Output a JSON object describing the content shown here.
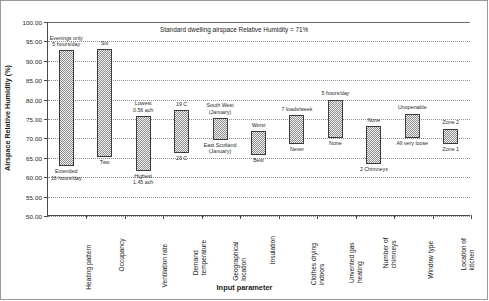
{
  "chart_data": {
    "type": "bar",
    "subtype": "floating-range-bar",
    "title": "",
    "note": "Standard dwelling airspace Relative Humidity = 71%",
    "xlabel": "Input parameter",
    "ylabel": "Airspace Relative Humidity (%)",
    "ylim": [
      50.0,
      100.0
    ],
    "ytick_step": 5.0,
    "ytick_labels": [
      "100.00",
      "95.00",
      "90.00",
      "85.00",
      "80.00",
      "75.00",
      "70.00",
      "65.00",
      "60.00",
      "55.00",
      "50.00"
    ],
    "grid": true,
    "legend": "none",
    "categories": [
      "Heating pattern",
      "Occupancy",
      "Ventilation rate",
      "Demand temperature",
      "Geographical location",
      "Insulation",
      "Clothes drying indoors",
      "Unvented gas heating",
      "Number of chimneys",
      "Window type",
      "Location of kitchen"
    ],
    "category_labels_wrapped": [
      "Heating pattern",
      "Occupancy",
      "Ventilation rate",
      "Demand\ntemperature",
      "Geographical\nlocation",
      "Insulation",
      "Clothes drying\nindoors",
      "Unvented gas\nheating",
      "Number of\nchimneys",
      "Window type",
      "Location of\nkitchen"
    ],
    "bars": [
      {
        "category": "Heating pattern",
        "low": 62.8,
        "high": 92.7,
        "top_label": "Evenings only\n5 hours/day",
        "bottom_label": "Extended\n16 hours/day"
      },
      {
        "category": "Occupancy",
        "low": 65.3,
        "high": 93.0,
        "top_label": "Six",
        "bottom_label": "Two"
      },
      {
        "category": "Ventilation rate",
        "low": 61.7,
        "high": 75.7,
        "top_label": "Lowest\n0.56 ach",
        "bottom_label": "Highest\n1.45 ach"
      },
      {
        "category": "Demand temperature",
        "low": 66.2,
        "high": 77.2,
        "top_label": "19 C",
        "bottom_label": "23 C"
      },
      {
        "category": "Geographical location",
        "low": 69.6,
        "high": 75.2,
        "top_label": "South West\n(January)",
        "bottom_label": "East Scotland\n(January)"
      },
      {
        "category": "Insulation",
        "low": 65.8,
        "high": 71.8,
        "top_label": "Worst",
        "bottom_label": "Best"
      },
      {
        "category": "Clothes drying indoors",
        "low": 68.5,
        "high": 76.0,
        "top_label": "7 loads/week",
        "bottom_label": "Never"
      },
      {
        "category": "Unvented gas heating",
        "low": 70.2,
        "high": 80.0,
        "top_label": "5 hours/day",
        "bottom_label": "None"
      },
      {
        "category": "Number of chimneys",
        "low": 63.5,
        "high": 73.2,
        "top_label": "None",
        "bottom_label": "2 Chimneys"
      },
      {
        "category": "Window type",
        "low": 70.2,
        "high": 76.4,
        "top_label": "Unopenable",
        "bottom_label": "All very loose"
      },
      {
        "category": "Location of kitchen",
        "low": 68.5,
        "high": 72.5,
        "top_label": "Zone 2",
        "bottom_label": "Zone 1"
      }
    ]
  },
  "colors": {
    "bar_fill": "#e8e8e8",
    "bar_pattern": "#8d8d8d",
    "bar_border": "#3a3a3a",
    "axis": "#4a4a4a",
    "grid": "#8f8f8f",
    "frame": "#9a9a9a",
    "text": "#1a1a1a"
  }
}
